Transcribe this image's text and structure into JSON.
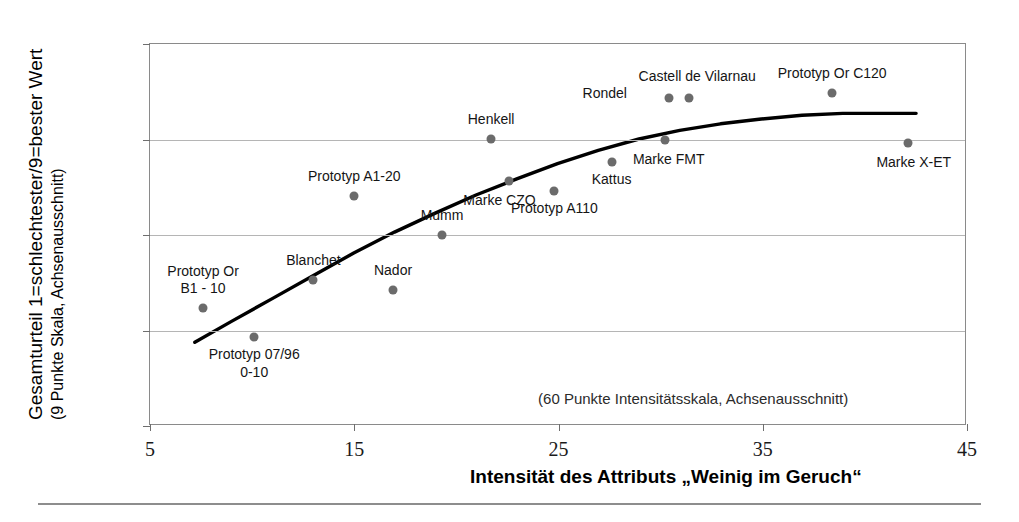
{
  "axes": {
    "y_label_main": "Gesamturteil 1=schlechtester/9=bester Wert",
    "y_label_sub": "(9 Punkte Skala, Achsenausschnitt)",
    "x_label": "Intensität des Attributs „Weinig im Geruch“",
    "note": "(60 Punkte Intensitätsskala, Achsenausschnitt)",
    "y_ticks": [
      "3.0",
      "4.0",
      "5.0",
      "6.0",
      "7.0"
    ],
    "x_ticks": [
      "5",
      "15",
      "25",
      "35",
      "45"
    ]
  },
  "chart_data": {
    "type": "scatter",
    "title": "",
    "xlabel": "Intensität des Attributs „Weinig im Geruch“",
    "ylabel": "Gesamturteil 1=schlechtester/9=bester Wert (9 Punkte Skala, Achsenausschnitt)",
    "xlim": [
      5,
      45
    ],
    "ylim": [
      3.0,
      7.0
    ],
    "xticks": [
      5,
      15,
      25,
      35,
      45
    ],
    "yticks": [
      3.0,
      4.0,
      5.0,
      6.0,
      7.0
    ],
    "grid": "horizontal",
    "legend": "none",
    "annotations": [
      "(60 Punkte Intensitätsskala, Achsenausschnitt)"
    ],
    "points": [
      {
        "label": "Prototyp Or\nB1 - 10",
        "label_lines": [
          "Prototyp Or",
          "B1 - 10"
        ],
        "x": 7.6,
        "y": 4.24,
        "label_pos": "above"
      },
      {
        "label": "Prototyp 07/96\n0-10",
        "label_lines": [
          "Prototyp 07/96",
          "0-10"
        ],
        "x": 10.1,
        "y": 3.93,
        "label_pos": "below"
      },
      {
        "label": "Blanchet",
        "label_lines": [
          "Blanchet"
        ],
        "x": 13.0,
        "y": 4.53,
        "label_pos": "above"
      },
      {
        "label": "Prototyp A1-20",
        "label_lines": [
          "Prototyp A1-20"
        ],
        "x": 15.0,
        "y": 5.41,
        "label_pos": "above"
      },
      {
        "label": "Nador",
        "label_lines": [
          "Nador"
        ],
        "x": 16.9,
        "y": 4.42,
        "label_pos": "above"
      },
      {
        "label": "Mumm",
        "label_lines": [
          "Mumm"
        ],
        "x": 19.3,
        "y": 5.0,
        "label_pos": "above"
      },
      {
        "label": "Henkell",
        "label_lines": [
          "Henkell"
        ],
        "x": 21.7,
        "y": 6.01,
        "label_pos": "above"
      },
      {
        "label": "Marke CZO",
        "label_lines": [
          "Marke CZO"
        ],
        "x": 22.6,
        "y": 5.57,
        "label_pos": "below"
      },
      {
        "label": "Prototyp A110",
        "label_lines": [
          "Prototyp A110"
        ],
        "x": 24.8,
        "y": 5.46,
        "label_pos": "below"
      },
      {
        "label": "Kattus",
        "label_lines": [
          "Kattus"
        ],
        "x": 27.6,
        "y": 5.76,
        "label_pos": "below"
      },
      {
        "label": "Marke FMT",
        "label_lines": [
          "Marke FMT"
        ],
        "x": 30.2,
        "y": 5.99,
        "label_pos": "below"
      },
      {
        "label": "Rondel",
        "label_lines": [
          "Rondel"
        ],
        "x": 30.4,
        "y": 6.43,
        "label_pos": "left"
      },
      {
        "label": "Castell de Vilarnau",
        "label_lines": [
          "Castell de Vilarnau"
        ],
        "x": 31.4,
        "y": 6.43,
        "label_pos": "above"
      },
      {
        "label": "Prototyp Or C120",
        "label_lines": [
          "Prototyp Or C120"
        ],
        "x": 38.4,
        "y": 6.49,
        "label_pos": "above"
      },
      {
        "label": "Marke X-ET",
        "label_lines": [
          "Marke X-ET"
        ],
        "x": 42.1,
        "y": 5.96,
        "label_pos": "below"
      }
    ],
    "trend_line": {
      "name": "Trendkurve",
      "color": "#000000",
      "x": [
        7.2,
        9.0,
        11.0,
        13.0,
        15.0,
        17.0,
        19.0,
        21.0,
        23.0,
        25.0,
        27.0,
        29.0,
        31.0,
        33.0,
        35.0,
        37.0,
        39.0,
        41.0,
        42.6
      ],
      "y": [
        3.86,
        4.08,
        4.32,
        4.56,
        4.8,
        5.02,
        5.22,
        5.41,
        5.58,
        5.74,
        5.88,
        6.0,
        6.09,
        6.16,
        6.21,
        6.25,
        6.27,
        6.27,
        6.27
      ]
    }
  },
  "colors": {
    "point": "#6b6b6b",
    "trend": "#000000",
    "grid": "#b5b5b5",
    "frame": "#8a8a8a"
  }
}
